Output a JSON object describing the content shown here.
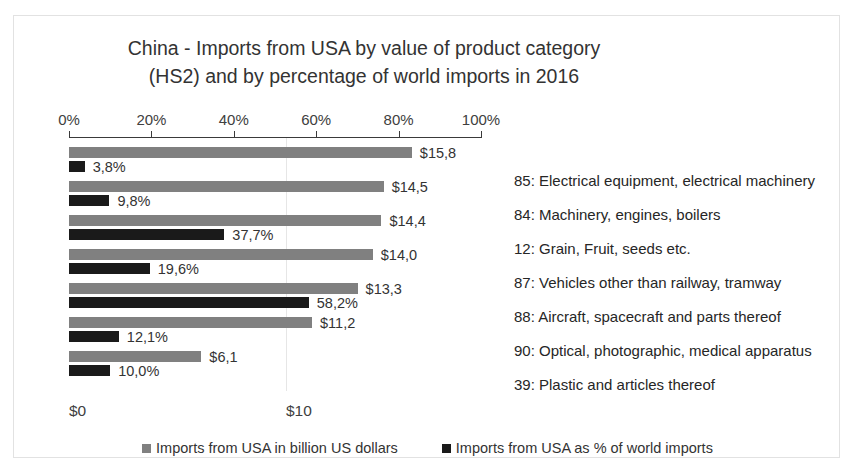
{
  "chart_data": {
    "type": "bar",
    "orientation": "horizontal",
    "title": "China - Imports from USA by value of product category (HS2) and by percentage of world imports in 2016",
    "title_lines": [
      "China - Imports from USA by value of product category",
      "(HS2) and by percentage of world imports in 2016"
    ],
    "categories": [
      "85: Electrical equipment, electrical machinery",
      "84: Machinery, engines, boilers",
      "12: Grain, Fruit, seeds etc.",
      "87: Vehicles other than railway, tramway",
      "88: Aircraft, spacecraft and parts thereof",
      "90: Optical, photographic, medical apparatus",
      "39: Plastic and articles thereof"
    ],
    "series": [
      {
        "name": "Imports from USA in billion US dollars",
        "color": "#808080",
        "unit": "billion US dollars",
        "values": [
          15.8,
          14.5,
          14.4,
          14.0,
          13.3,
          11.2,
          6.1
        ],
        "labels": [
          "$15,8",
          "$14,5",
          "$14,4",
          "$14,0",
          "$13,3",
          "$11,2",
          "$6,1"
        ]
      },
      {
        "name": "Imports from USA as % of world imports",
        "color": "#1a1a1a",
        "unit": "percent",
        "values": [
          3.8,
          9.8,
          37.7,
          19.6,
          58.2,
          12.1,
          10.0
        ],
        "labels": [
          "3,8%",
          "9,8%",
          "37,7%",
          "19,6%",
          "58,2%",
          "12,1%",
          "10,0%"
        ]
      }
    ],
    "top_axis": {
      "label": "percentage of world imports",
      "ticks": [
        0,
        20,
        40,
        60,
        80,
        100
      ],
      "tick_labels": [
        "0%",
        "20%",
        "40%",
        "60%",
        "80%",
        "100%"
      ],
      "range": [
        0,
        100
      ]
    },
    "bottom_axis": {
      "label": "billion US dollars",
      "ticks": [
        0,
        10
      ],
      "tick_labels": [
        "$0",
        "$10"
      ],
      "range": [
        0,
        19.0
      ]
    },
    "grid": true,
    "gridlines": [
      "$10"
    ],
    "legend_position": "bottom"
  },
  "legend": {
    "entries": [
      {
        "label": "Imports from USA in billion US dollars",
        "color": "#808080"
      },
      {
        "label": "Imports from USA as % of world imports",
        "color": "#1a1a1a"
      }
    ]
  }
}
